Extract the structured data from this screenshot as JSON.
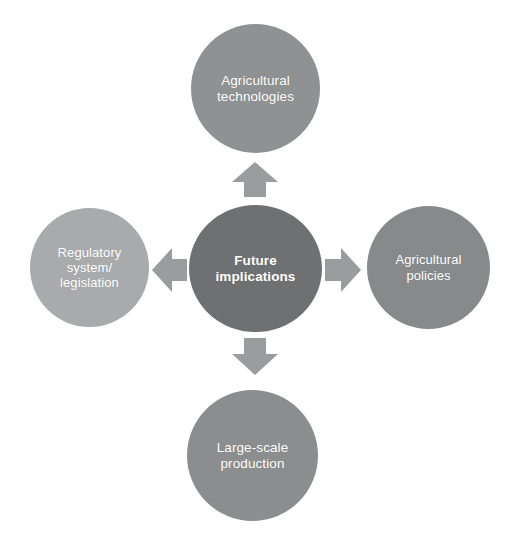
{
  "diagram": {
    "type": "hub-and-spoke",
    "title": "Future implications",
    "background_color": "#ffffff",
    "center": {
      "label": "Future\nimplications",
      "color": "#6e7072",
      "text_color": "#ffffff",
      "shape": "ellipse"
    },
    "nodes": [
      {
        "id": "agricultural-technologies",
        "label": "Agricultural\ntechnologies",
        "position": "top",
        "color": "#8f9192",
        "text_color": "#ffffff",
        "shape": "circle"
      },
      {
        "id": "agricultural-policies",
        "label": "Agricultural\npolicies",
        "position": "right",
        "color": "#87898a",
        "text_color": "#ffffff",
        "shape": "circle"
      },
      {
        "id": "large-scale-production",
        "label": "Large-scale\nproduction",
        "position": "bottom",
        "color": "#8b8d8e",
        "text_color": "#ffffff",
        "shape": "circle"
      },
      {
        "id": "regulatory-system-legislation",
        "label": "Regulatory\nsystem/\nlegislation",
        "position": "left",
        "color": "#a8aaab",
        "text_color": "#ffffff",
        "shape": "circle"
      }
    ],
    "arrows": [
      {
        "id": "arrow-up",
        "direction": "up",
        "color": "#9a9c9d",
        "from": "center",
        "to": "agricultural-technologies"
      },
      {
        "id": "arrow-right",
        "direction": "right",
        "color": "#9a9c9d",
        "from": "center",
        "to": "agricultural-policies"
      },
      {
        "id": "arrow-down",
        "direction": "down",
        "color": "#9a9c9d",
        "from": "center",
        "to": "large-scale-production"
      },
      {
        "id": "arrow-left",
        "direction": "left",
        "color": "#9a9c9d",
        "from": "center",
        "to": "regulatory-system-legislation"
      }
    ]
  }
}
